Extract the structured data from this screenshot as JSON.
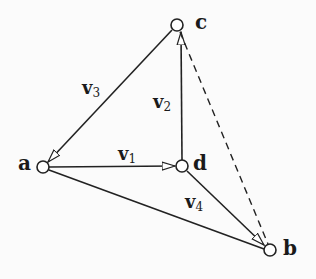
{
  "diagram": {
    "type": "directed graph",
    "nodes": [
      {
        "id": "a",
        "label": "a",
        "x": 43,
        "y": 167
      },
      {
        "id": "b",
        "label": "b",
        "x": 270,
        "y": 250
      },
      {
        "id": "c",
        "label": "c",
        "x": 177,
        "y": 25
      },
      {
        "id": "d",
        "label": "d",
        "x": 182,
        "y": 166
      }
    ],
    "edges": [
      {
        "from": "a",
        "to": "d",
        "label": "v",
        "sub": "1",
        "style": "solid",
        "arrow": true
      },
      {
        "from": "d",
        "to": "c",
        "label": "v",
        "sub": "2",
        "style": "solid",
        "arrow": true
      },
      {
        "from": "c",
        "to": "a",
        "label": "v",
        "sub": "3",
        "style": "solid",
        "arrow": true
      },
      {
        "from": "d",
        "to": "b",
        "label": "v",
        "sub": "4",
        "style": "solid",
        "arrow": true
      },
      {
        "from": "a",
        "to": "b",
        "label": "",
        "style": "solid",
        "arrow": false
      },
      {
        "from": "c",
        "to": "b",
        "label": "",
        "style": "dashed",
        "arrow": false
      }
    ]
  }
}
